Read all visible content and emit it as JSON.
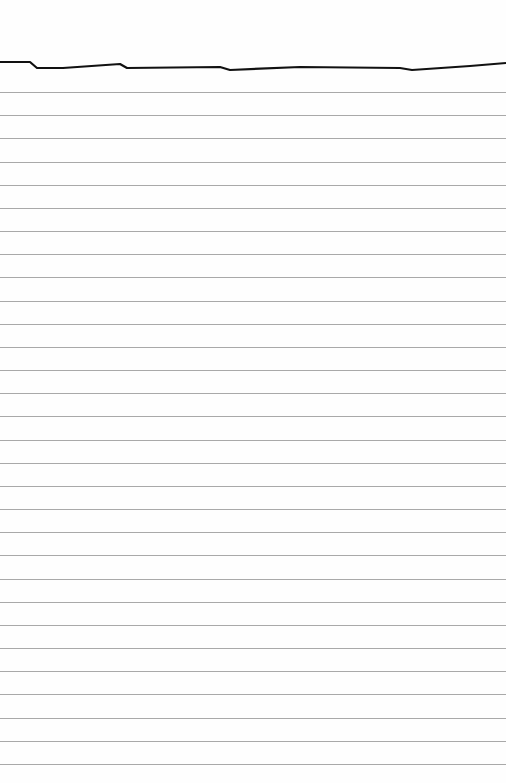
{
  "paper": {
    "background": "#fefefe",
    "rule_color": "#a9a9a9",
    "rule_count": 30,
    "first_rule_y": 92,
    "rule_spacing": 23.17,
    "header_line_color": "#111111",
    "header_line_points": "0,62 30,62 37,68 63,68 120,64 127,68 220,67 230,70 300,67 400,68 412,70 470,66 506,63"
  }
}
